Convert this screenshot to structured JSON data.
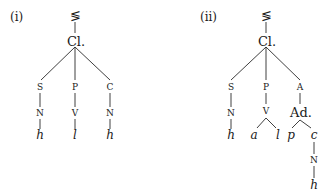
{
  "trees": [
    {
      "label": "(i)",
      "top": "≶",
      "root": "Cl.",
      "branches": [
        {
          "node": "S",
          "child": "N",
          "leaf": "h"
        },
        {
          "node": "P",
          "child": "V",
          "leaf": "l"
        },
        {
          "node": "C",
          "child": "N",
          "leaf": "h"
        }
      ]
    },
    {
      "label": "(ii)",
      "top": "≶",
      "root": "Cl.",
      "branches": [
        {
          "node": "S",
          "child": "N",
          "leaf": "h"
        },
        {
          "node": "P",
          "child": "V",
          "leaves": [
            "a",
            "l"
          ]
        },
        {
          "node": "A",
          "child": "Ad.",
          "leaves": [
            "p",
            "c"
          ],
          "sub": {
            "child": "N",
            "leaf": "h"
          }
        }
      ]
    }
  ]
}
